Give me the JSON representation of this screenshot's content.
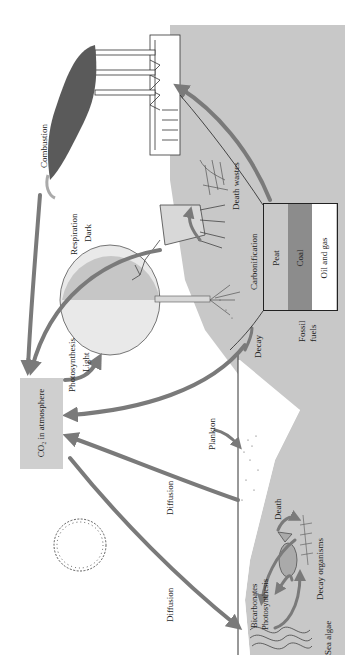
{
  "diagram": {
    "orientation": "rotated 90 degrees counter-clockwise",
    "colors": {
      "arrow": "#7a7a7a",
      "ground": "#c8c8c8",
      "co2_box": "#cfcfcf",
      "peat": "#c9c9c9",
      "coal": "#8c8c8c",
      "oil_gas": "#ffffff",
      "ink": "#222222"
    },
    "co2_box": {
      "label": "CO₂ in atmosphere"
    },
    "fossil_fuels": {
      "label": "Fossil fuels",
      "label_line1": "Fossil",
      "label_line2": "fuels",
      "layers": [
        {
          "name": "Peat"
        },
        {
          "name": "Coal"
        },
        {
          "name": "Oil and gas"
        }
      ]
    },
    "labels": {
      "combustion": "Combustion",
      "respiration": "Respiration",
      "dark": "Dark",
      "photosynthesis_land": "Photosynthesis",
      "light": "Light",
      "death_wastes": "Death wastes",
      "carbonification": "Carbonification",
      "decay": "Decay",
      "plankton": "Plankton",
      "diffusion_1": "Diffusion",
      "diffusion_2": "Diffusion",
      "death": "Death",
      "decay_organisms": "Decay organisms",
      "bicarbonates": "Bicarbonates",
      "photosynthesis_sea": "Photosynthesis",
      "sea_algae": "Sea algae"
    },
    "elements": [
      "factory with smokestacks",
      "smoke plume",
      "tree",
      "deer",
      "animal remains",
      "sun",
      "fish",
      "fish skeleton",
      "sea algae",
      "sea surface line",
      "ground / sediment"
    ]
  }
}
